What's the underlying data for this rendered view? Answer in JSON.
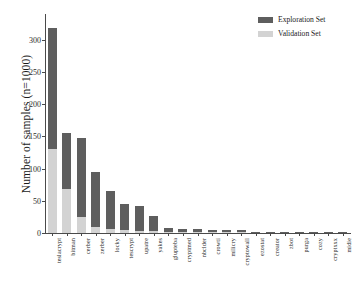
{
  "chart_data": {
    "type": "bar",
    "title": "",
    "xlabel": "",
    "ylabel": "Number of samples (n=1000)",
    "ylim": [
      0,
      340
    ],
    "yticks": [
      0,
      50,
      100,
      150,
      200,
      250,
      300
    ],
    "grid": false,
    "stacked": true,
    "legend_position": "top-right",
    "categories": [
      "teslacrypt",
      "bitman",
      "cerber",
      "zerber",
      "locky",
      "tescrypt",
      "upatre",
      "yakes",
      "glupteba",
      "cryptmed",
      "nbclder",
      "crowti",
      "milicry",
      "cryptowall",
      "ezostat",
      "creator",
      "zbot",
      "purga",
      "cozy",
      "cryptxxx",
      "midie"
    ],
    "series": [
      {
        "name": "Validation Set",
        "color": "#d3d3d3",
        "values": [
          130,
          68,
          25,
          10,
          7,
          4,
          3,
          3,
          1,
          1,
          1,
          1,
          1,
          1,
          0,
          0,
          0,
          0,
          0,
          0,
          0
        ]
      },
      {
        "name": "Exploration Set",
        "color": "#5e5e5e",
        "values": [
          189,
          88,
          122,
          85,
          58,
          41,
          39,
          24,
          7,
          5,
          5,
          4,
          4,
          3,
          1,
          1,
          1,
          1,
          1,
          1,
          1
        ]
      }
    ],
    "totals": [
      319,
      156,
      147,
      95,
      65,
      45,
      42,
      27,
      8,
      6,
      6,
      5,
      5,
      4,
      1,
      1,
      1,
      1,
      1,
      1,
      1
    ]
  },
  "legend": {
    "entries": [
      {
        "label": "Exploration Set",
        "color": "#5e5e5e"
      },
      {
        "label": "Validation Set",
        "color": "#d3d3d3"
      }
    ]
  }
}
